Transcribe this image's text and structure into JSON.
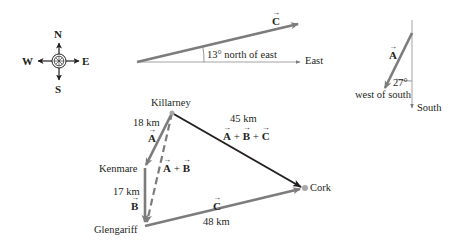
{
  "compass": {
    "north": "N",
    "south": "S",
    "east": "E",
    "west": "W"
  },
  "vector_c_direction": {
    "vector_label": "C",
    "angle_label": "13° north of east",
    "axis_label": "East"
  },
  "vector_a_direction": {
    "vector_label": "A",
    "angle_label": "27°",
    "direction_label": "west of south",
    "axis_label": "South"
  },
  "map": {
    "towns": {
      "killarney": "Killarney",
      "kenmare": "Kenmare",
      "glengariff": "Glengariff",
      "cork": "Cork"
    },
    "legs": [
      {
        "vector": "A",
        "distance": "18 km",
        "from": "Killarney",
        "to": "Kenmare"
      },
      {
        "vector": "B",
        "distance": "17 km",
        "from": "Kenmare",
        "to": "Glengariff"
      },
      {
        "vector": "C",
        "distance": "48 km",
        "from": "Glengariff",
        "to": "Cork"
      }
    ],
    "sum_ab": {
      "label_a": "A",
      "plus": "+",
      "label_b": "B"
    },
    "resultant": {
      "distance": "45 km",
      "label_a": "A",
      "label_b": "B",
      "label_c": "C",
      "plus": "+"
    }
  },
  "colors": {
    "vector_gray": "#7d7b7c",
    "resultant_black": "#231f20",
    "axis_gray": "#9a9899",
    "point_gray": "#a8a6a7"
  }
}
